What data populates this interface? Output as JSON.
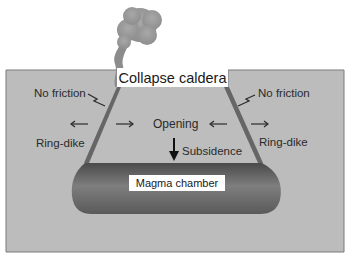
{
  "diagram": {
    "title": "Collapse caldera",
    "labels": {
      "no_friction_left": "No friction",
      "no_friction_right": "No friction",
      "opening": "Opening",
      "subsidence": "Subsidence",
      "ring_dike_left": "Ring-dike",
      "ring_dike_right": "Ring-dike",
      "magma_chamber": "Magma chamber"
    },
    "colors": {
      "crust": "#bcbcbc",
      "crust_border": "#7a7a7a",
      "ring_dike": "#6a6a6a",
      "magma_dark": "#555555",
      "magma_light": "#8a8a8a",
      "plume": "#9a9a9a",
      "text": "#2a2a2a"
    }
  }
}
